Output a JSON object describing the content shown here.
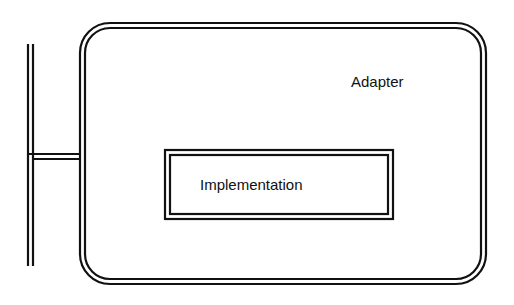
{
  "diagram": {
    "type": "adapter-pattern",
    "colors": {
      "stroke": "#111111",
      "background": "#ffffff"
    },
    "adapter": {
      "label": "Adapter"
    },
    "implementation": {
      "label": "Implementation"
    },
    "connector": {
      "description": "double-line interface bar attached to Adapter left side"
    }
  }
}
